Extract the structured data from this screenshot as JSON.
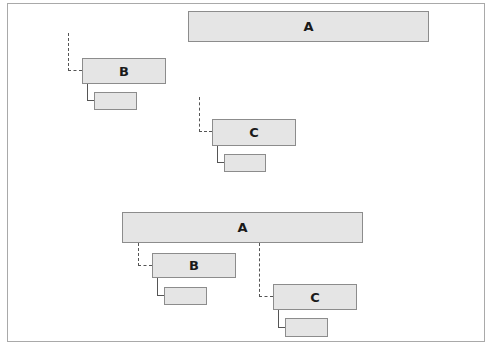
{
  "diagrams": [
    {
      "name": "before",
      "nodes": {
        "A": {
          "label": "A"
        },
        "B": {
          "label": "B"
        },
        "B_child": {
          "label": ""
        },
        "C": {
          "label": "C"
        },
        "C_child": {
          "label": ""
        }
      }
    },
    {
      "name": "after",
      "nodes": {
        "A": {
          "label": "A"
        },
        "B": {
          "label": "B"
        },
        "B_child": {
          "label": ""
        },
        "C": {
          "label": "C"
        },
        "C_child": {
          "label": ""
        }
      }
    }
  ],
  "colors": {
    "box_fill": "#e5e5e5",
    "box_border": "#8c8c8c",
    "connector": "#555555",
    "frame_border": "#a9a9a9"
  }
}
